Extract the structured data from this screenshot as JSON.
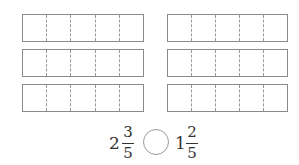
{
  "diagram": {
    "bars": {
      "segments_per_bar": 5,
      "left_column": [
        {
          "id": 1
        },
        {
          "id": 2
        },
        {
          "id": 3
        }
      ],
      "right_column": [
        {
          "id": 1
        },
        {
          "id": 2
        },
        {
          "id": 3
        }
      ]
    },
    "comparison": {
      "left": {
        "whole": "2",
        "numerator": "3",
        "denominator": "5"
      },
      "comparator_placeholder": "",
      "right": {
        "whole": "1",
        "numerator": "2",
        "denominator": "5"
      }
    },
    "colors": {
      "bar_border": "#8a8a8a",
      "dashed_divider": "#9a9a9a",
      "text": "#333333"
    }
  }
}
